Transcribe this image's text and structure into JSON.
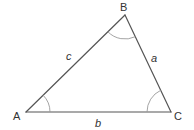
{
  "diagram": {
    "type": "triangle",
    "vertices": {
      "A": {
        "label": "A",
        "x": 26,
        "y": 112
      },
      "B": {
        "label": "B",
        "x": 125,
        "y": 15
      },
      "C": {
        "label": "C",
        "x": 171,
        "y": 112
      }
    },
    "sides": {
      "a": {
        "label": "a",
        "between": "B-C"
      },
      "b": {
        "label": "b",
        "between": "A-C"
      },
      "c": {
        "label": "c",
        "between": "A-B"
      }
    },
    "angle_marks": [
      "A",
      "B",
      "C"
    ],
    "colors": {
      "edge": "#555555",
      "arc": "#9a9a9a",
      "text": "#333333",
      "background": "#ffffff"
    }
  }
}
